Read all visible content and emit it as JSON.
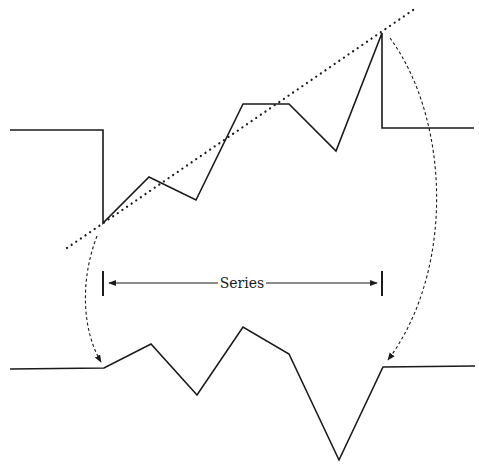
{
  "diagram": {
    "title": "",
    "series_label": "Series",
    "colors": {
      "line": "#1a1a1a",
      "background": "#ffffff"
    },
    "top_series": {
      "description": "Original time series with upward trend between flat segments",
      "points": [
        [
          10,
          130
        ],
        [
          103,
          130
        ],
        [
          103,
          223
        ],
        [
          149,
          177
        ],
        [
          196,
          200
        ],
        [
          243,
          104
        ],
        [
          289,
          104
        ],
        [
          336,
          151
        ],
        [
          382,
          33
        ],
        [
          382,
          128
        ],
        [
          474,
          128
        ]
      ]
    },
    "trend_line": {
      "style": "dotted",
      "from": [
        67,
        248
      ],
      "to": [
        416,
        8
      ]
    },
    "bottom_series": {
      "description": "Detrended series between flat segments",
      "points": [
        [
          10,
          369
        ],
        [
          104,
          368
        ],
        [
          151,
          344
        ],
        [
          197,
          395
        ],
        [
          243,
          327
        ],
        [
          289,
          354
        ],
        [
          339,
          460
        ],
        [
          383,
          367
        ],
        [
          475,
          366
        ]
      ]
    },
    "bracket": {
      "left_x": 103,
      "right_x": 382,
      "y": 283,
      "tick_top": 271,
      "tick_bottom": 296
    },
    "arrows": [
      {
        "name": "left-mapping-arrow",
        "style": "dashed",
        "path": "M97,236 C80,280 82,330 101,362"
      },
      {
        "name": "right-mapping-arrow",
        "style": "dashed",
        "path": "M390,38 C450,120 455,270 388,360"
      }
    ]
  }
}
